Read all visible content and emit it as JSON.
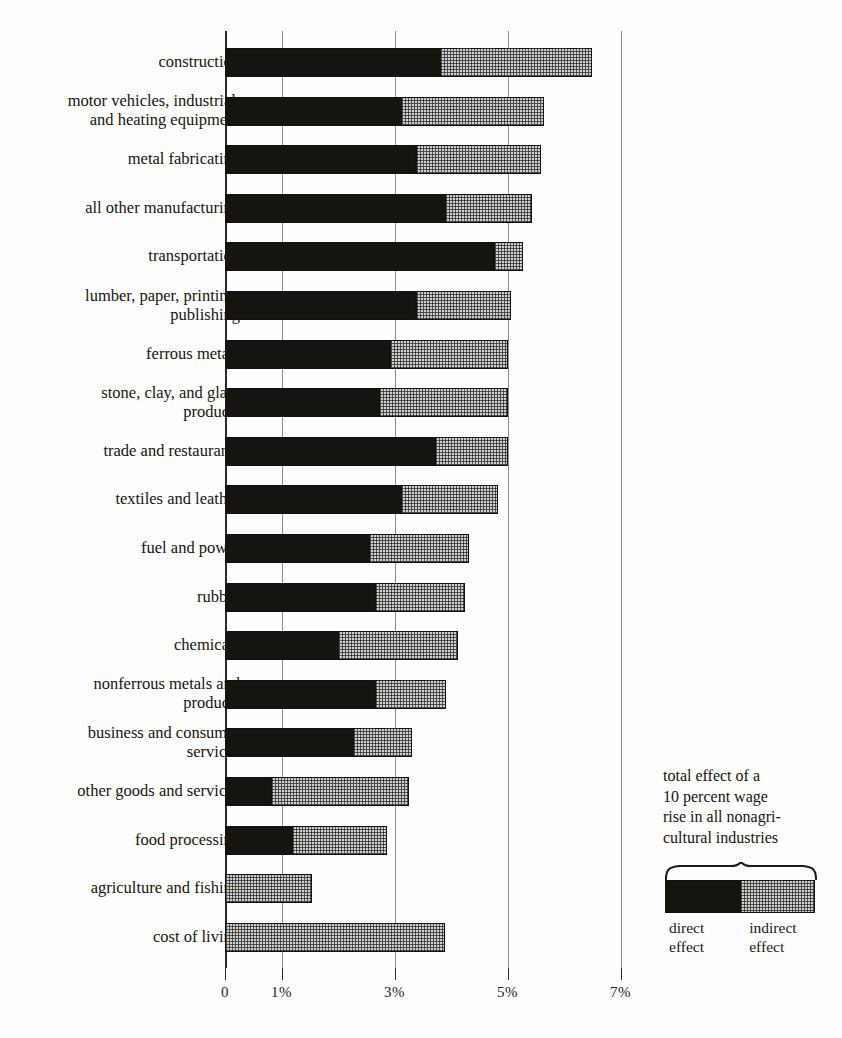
{
  "chart_data": {
    "type": "bar",
    "orientation": "horizontal",
    "stacked": true,
    "title": "",
    "xlabel": "",
    "ylabel": "",
    "xlim": [
      0,
      7
    ],
    "grid": true,
    "grid_axis": "x",
    "xticks": [
      0,
      1,
      3,
      5,
      7
    ],
    "xtick_labels": [
      "0",
      "1%",
      "3%",
      "5%",
      "7%"
    ],
    "categories": [
      "construction",
      "motor vehicles, industrial,\nand heating equipment",
      "metal fabricating",
      "all other manufacturing",
      "transportation",
      "lumber, paper,  printing,\npublishing",
      "ferrous metals",
      "stone, clay, and glass\nproducts",
      "trade and restaurants",
      "textiles and leather",
      "fuel and power",
      "rubber",
      "chemicals",
      "nonferrous metals and\nproducts",
      "business and consumer\nservices",
      "other goods and services",
      "food processing",
      "agriculture and fishing",
      "cost of living"
    ],
    "series": [
      {
        "name": "direct effect",
        "color": "#16140f",
        "values": [
          3.78,
          3.1,
          3.35,
          3.87,
          4.73,
          3.35,
          2.89,
          2.71,
          3.69,
          3.09,
          2.52,
          2.63,
          1.98,
          2.63,
          2.25,
          0.8,
          1.17,
          0.0,
          0.0
        ]
      },
      {
        "name": "indirect effect",
        "color": "#cfcfcb",
        "values": [
          2.72,
          2.55,
          2.25,
          1.56,
          0.54,
          1.72,
          2.11,
          2.29,
          1.31,
          1.75,
          1.79,
          1.61,
          2.15,
          1.29,
          1.06,
          2.45,
          1.7,
          1.54,
          3.89
        ]
      }
    ],
    "totals": [
      6.5,
      5.65,
      5.6,
      5.43,
      5.27,
      5.07,
      5.0,
      5.0,
      5.0,
      4.84,
      4.31,
      4.24,
      4.13,
      3.92,
      3.31,
      3.25,
      2.87,
      1.54,
      3.89
    ],
    "legend": {
      "position": "bottom-right",
      "title": "total effect of a\n10 percent wage\nrise in all nonagri-\ncultural industries",
      "entries": [
        {
          "label": "direct\neffect",
          "color": "#16140f"
        },
        {
          "label": "indirect\neffect",
          "color": "#cfcfcb"
        }
      ]
    }
  }
}
